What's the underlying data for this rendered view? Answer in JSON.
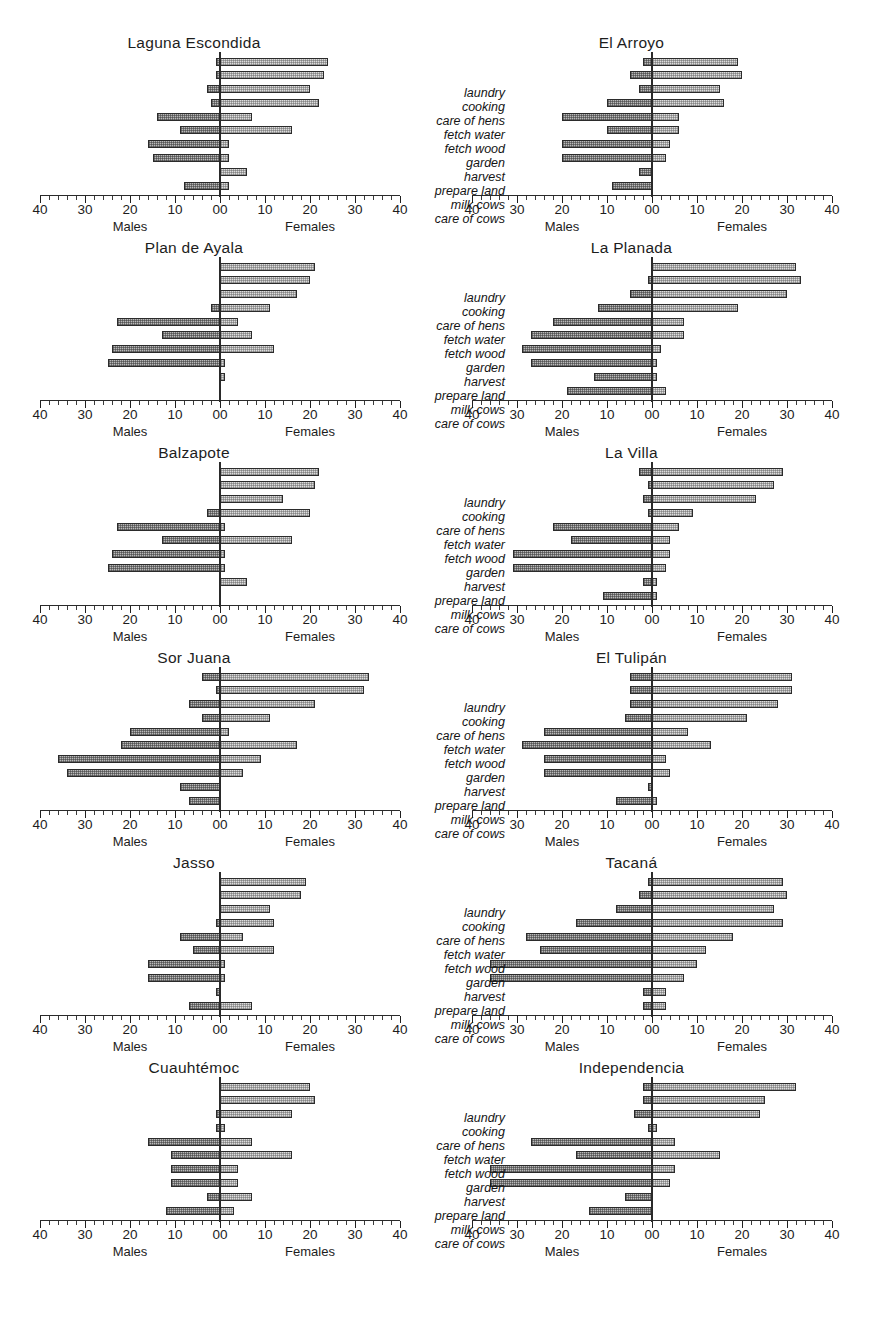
{
  "figure": {
    "axis_left_label": "Males",
    "axis_right_label": "Females",
    "tick_labels": [
      "40",
      "30",
      "20",
      "10",
      "00",
      "10",
      "20",
      "30",
      "40"
    ],
    "tasks": [
      "laundry",
      "cooking",
      "care of hens",
      "fetch water",
      "fetch wood",
      "garden",
      "harvest",
      "prepare land",
      "milk cows",
      "care of cows"
    ],
    "caption": ""
  },
  "chart_data": {
    "type": "bar",
    "subtype": "population-pyramid",
    "title": "",
    "xlabel": "",
    "ylabel": "",
    "xlim": [
      -40,
      40
    ],
    "grid": false,
    "legend": [
      "Males",
      "Females"
    ],
    "categories": [
      "laundry",
      "cooking",
      "care of hens",
      "fetch water",
      "fetch wood",
      "garden",
      "harvest",
      "prepare land",
      "milk cows",
      "care of cows"
    ],
    "panels": [
      {
        "name": "Laguna Escondida",
        "males": [
          1,
          1,
          3,
          2,
          14,
          9,
          16,
          15,
          0,
          8
        ],
        "females": [
          24,
          23,
          20,
          22,
          7,
          16,
          2,
          2,
          6,
          2
        ]
      },
      {
        "name": "El Arroyo",
        "males": [
          2,
          5,
          3,
          10,
          20,
          10,
          20,
          20,
          3,
          9
        ],
        "females": [
          19,
          20,
          15,
          16,
          6,
          6,
          4,
          3,
          0,
          0
        ]
      },
      {
        "name": "Plan de Ayala",
        "males": [
          0,
          0,
          0,
          2,
          23,
          13,
          24,
          25,
          0,
          0
        ],
        "females": [
          21,
          20,
          17,
          11,
          4,
          7,
          12,
          1,
          1,
          0
        ]
      },
      {
        "name": "La Planada",
        "males": [
          0,
          1,
          5,
          12,
          22,
          27,
          29,
          27,
          13,
          19
        ],
        "females": [
          32,
          33,
          30,
          19,
          7,
          7,
          2,
          1,
          1,
          3
        ]
      },
      {
        "name": "Balzapote",
        "males": [
          0,
          0,
          0,
          3,
          23,
          13,
          24,
          25,
          0,
          0
        ],
        "females": [
          22,
          21,
          14,
          20,
          1,
          16,
          1,
          1,
          6,
          0
        ]
      },
      {
        "name": "La Villa",
        "males": [
          3,
          1,
          2,
          1,
          22,
          18,
          31,
          31,
          2,
          11
        ],
        "females": [
          29,
          27,
          23,
          9,
          6,
          4,
          4,
          3,
          1,
          1
        ]
      },
      {
        "name": "Sor Juana",
        "males": [
          4,
          1,
          7,
          4,
          20,
          22,
          36,
          34,
          9,
          7
        ],
        "females": [
          33,
          32,
          21,
          11,
          2,
          17,
          9,
          5,
          0,
          0
        ]
      },
      {
        "name": "El Tulipán",
        "males": [
          5,
          5,
          5,
          6,
          24,
          29,
          24,
          24,
          1,
          8
        ],
        "females": [
          31,
          31,
          28,
          21,
          8,
          13,
          3,
          4,
          0,
          1
        ]
      },
      {
        "name": "Jasso",
        "males": [
          0,
          0,
          0,
          1,
          9,
          6,
          16,
          16,
          1,
          7
        ],
        "females": [
          19,
          18,
          11,
          12,
          5,
          12,
          1,
          1,
          0,
          7
        ]
      },
      {
        "name": "Tacaná",
        "males": [
          1,
          3,
          8,
          17,
          28,
          25,
          36,
          36,
          2,
          2
        ],
        "females": [
          29,
          30,
          27,
          29,
          18,
          12,
          10,
          7,
          3,
          3
        ]
      },
      {
        "name": "Cuauhtémoc",
        "males": [
          0,
          0,
          1,
          1,
          16,
          11,
          11,
          11,
          3,
          12
        ],
        "females": [
          20,
          21,
          16,
          1,
          7,
          16,
          4,
          4,
          7,
          3
        ]
      },
      {
        "name": "Independencia",
        "males": [
          2,
          2,
          4,
          1,
          27,
          17,
          36,
          36,
          6,
          14
        ],
        "females": [
          32,
          25,
          24,
          1,
          5,
          15,
          5,
          4,
          0,
          0
        ]
      }
    ]
  }
}
